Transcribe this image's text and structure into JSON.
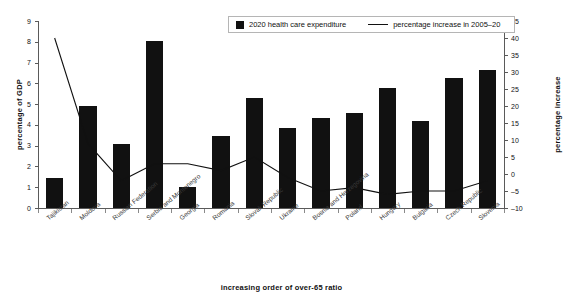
{
  "chart_data": {
    "type": "bar",
    "title": "",
    "xlabel": "increasing order of over-65 ratio",
    "ylabel": "percentage of  GDP",
    "y2label": "percentage increase",
    "ylim": [
      0,
      9
    ],
    "y2lim": [
      -10,
      45
    ],
    "yticks": [
      "0",
      "1",
      "2",
      "3",
      "4",
      "5",
      "6",
      "7",
      "8",
      "9"
    ],
    "y2ticks": [
      "-10",
      "-5",
      "0",
      "5",
      "10",
      "15",
      "20",
      "25",
      "30",
      "35",
      "40",
      "45"
    ],
    "grid": false,
    "legend_position": "top-center",
    "categories": [
      "Tajikistan",
      "Moldova",
      "Russian Federation",
      "Serbia and Montenegro",
      "Georgia",
      "Romania",
      "Slovak Republic",
      "Ukraine",
      "Bosnia and Herzegovina",
      "Poland",
      "Hungary",
      "Bulgaria",
      "Czech Republic",
      "Slovenia"
    ],
    "series": [
      {
        "name": "2020 health care expenditure",
        "type": "bar",
        "axis": "left",
        "unit": "percentage of GDP",
        "color": "#111111",
        "values": [
          1.45,
          4.9,
          3.1,
          8.05,
          1.0,
          3.45,
          5.3,
          3.85,
          4.35,
          4.55,
          5.8,
          4.2,
          6.25,
          6.65
        ]
      },
      {
        "name": "percentage increase in 2005–20",
        "type": "line",
        "axis": "right",
        "unit": "percentage increase",
        "color": "#111111",
        "values": [
          40,
          9,
          -2,
          3,
          3,
          1,
          5,
          -1,
          -5,
          -4,
          -6,
          -5,
          -5,
          -2
        ]
      }
    ]
  },
  "legend": {
    "bar_label": "2020 health care expenditure",
    "line_label": "percentage increase in 2005–20"
  },
  "icons": {
    "bar_swatch": "filled-square-icon",
    "line_swatch": "line-segment-icon"
  }
}
